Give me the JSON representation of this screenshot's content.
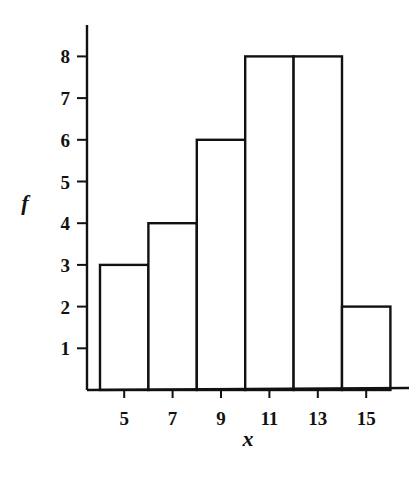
{
  "chart_data": {
    "type": "bar",
    "subtype": "histogram",
    "title": "",
    "xlabel": "x",
    "ylabel": "f",
    "categories": [
      "5",
      "7",
      "9",
      "11",
      "13",
      "15"
    ],
    "class_midpoints": [
      5,
      7,
      9,
      11,
      13,
      15
    ],
    "class_width": 2,
    "values": [
      3,
      4,
      6,
      8,
      8,
      2
    ],
    "x_tick_labels": [
      "5",
      "7",
      "9",
      "11",
      "13",
      "15"
    ],
    "y_tick_labels": [
      "1",
      "2",
      "3",
      "4",
      "5",
      "6",
      "7",
      "8"
    ],
    "ylim": [
      0,
      8.5
    ],
    "xlim": [
      3.5,
      16.5
    ],
    "grid": false,
    "legend": null,
    "bar_fill": "#ffffff",
    "bar_edge": "#111111"
  }
}
